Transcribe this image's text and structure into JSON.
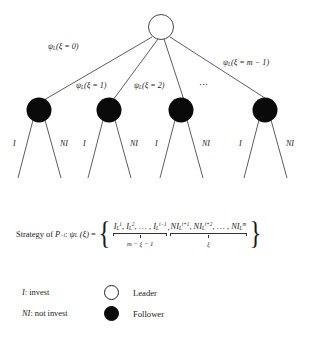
{
  "figure": {
    "type": "game-tree-diagram",
    "background_color": "#ffffff",
    "line_color": "#333333",
    "leader_node_fill": "#ffffff",
    "follower_node_fill": "#0a0a0a"
  },
  "tree": {
    "root": {
      "name": "leader-node",
      "role": "Leader",
      "fill": "#ffffff"
    },
    "edge_labels": [
      {
        "id": "edge-0",
        "text": "ψ",
        "sub": "L",
        "paren": "(ξ = 0)"
      },
      {
        "id": "edge-1",
        "text": "ψ",
        "sub": "L",
        "paren": "(ξ = 1)"
      },
      {
        "id": "edge-2",
        "text": "ψ",
        "sub": "L",
        "paren": "(ξ = 2)"
      },
      {
        "id": "edge-ellipsis",
        "text": "⋯"
      },
      {
        "id": "edge-m-1",
        "text": "ψ",
        "sub": "L",
        "paren": "(ξ = m − 1)"
      }
    ],
    "followers": [
      {
        "id": "follower-1",
        "role": "Follower",
        "fill": "#0a0a0a"
      },
      {
        "id": "follower-2",
        "role": "Follower",
        "fill": "#0a0a0a"
      },
      {
        "id": "follower-3",
        "role": "Follower",
        "fill": "#0a0a0a"
      },
      {
        "id": "follower-4",
        "role": "Follower",
        "fill": "#0a0a0a"
      }
    ],
    "action_labels": [
      {
        "invest": "I",
        "not_invest": "NI"
      },
      {
        "invest": "I",
        "not_invest": "NI"
      },
      {
        "invest": "I",
        "not_invest": "NI"
      },
      {
        "invest": "I",
        "not_invest": "NI"
      }
    ]
  },
  "strategy": {
    "lead_text": "Strategy of",
    "player": "P",
    "player_sub": "−i",
    "colon": ":",
    "function": "ψ",
    "function_sub": "L",
    "argument": "(ξ)",
    "equals": "=",
    "open_brace": "{",
    "close_brace": "}",
    "group_invest": {
      "terms": "I¹L, I²L, …, I^{i−1}L",
      "count_label": "m − ξ − 1"
    },
    "group_not_invest": {
      "terms": "NI^{i+1}L, NI^{i+2}L, …, NI^m L",
      "count_label": "ξ"
    },
    "separator": ","
  },
  "legend": {
    "abbreviations": [
      {
        "key": "I",
        "colon": ":",
        "meaning": "invest"
      },
      {
        "key": "NI",
        "colon": ":",
        "meaning": "not invest"
      }
    ],
    "nodes": [
      {
        "label": "Leader",
        "fill": "#ffffff",
        "style": "hollow"
      },
      {
        "label": "Follower",
        "fill": "#0a0a0a",
        "style": "filled"
      }
    ]
  }
}
